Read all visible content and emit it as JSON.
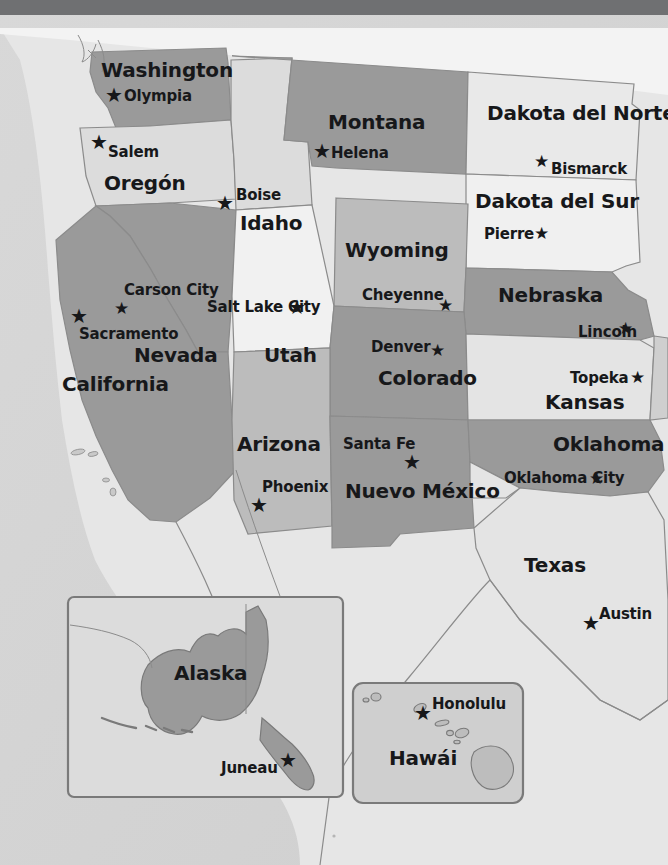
{
  "map": {
    "title": "Mapa del Oeste de Estados Unidos",
    "language": "es",
    "colors": {
      "ocean": "#d3d3d3",
      "land_light": "#eeeeee",
      "state_light": "#dcdcdc",
      "state_mid": "#c6c6c6",
      "state_dark": "#9a9a9a",
      "border": "#8b8b8b",
      "text": "#17181a",
      "topbar": "#6f7072",
      "inset_border": "#7a7a7a"
    },
    "topbar_height": 15
  },
  "states": [
    {
      "name": "Washington",
      "label_x": 101,
      "label_y": 60,
      "tone": "dark",
      "two_line": false
    },
    {
      "name": "Oregón",
      "label_x": 104,
      "label_y": 173,
      "tone": "light",
      "two_line": false
    },
    {
      "name": "Idaho",
      "label_x": 240,
      "label_y": 213,
      "tone": "light",
      "two_line": false
    },
    {
      "name": "Montana",
      "label_x": 328,
      "label_y": 112,
      "tone": "dark",
      "two_line": false
    },
    {
      "name": "Dakota del Norte",
      "label_x": 490,
      "label_y": 103,
      "tone": "light",
      "two_line": true
    },
    {
      "name": "Dakota del Sur",
      "label_x": 478,
      "label_y": 191,
      "tone": "light",
      "two_line": false
    },
    {
      "name": "Wyoming",
      "label_x": 345,
      "label_y": 240,
      "tone": "mid",
      "two_line": false
    },
    {
      "name": "Nebraska",
      "label_x": 500,
      "label_y": 285,
      "tone": "dark",
      "two_line": false
    },
    {
      "name": "Nevada",
      "label_x": 134,
      "label_y": 345,
      "tone": "dark",
      "two_line": false
    },
    {
      "name": "Utah",
      "label_x": 264,
      "label_y": 345,
      "tone": "light",
      "two_line": false
    },
    {
      "name": "California",
      "label_x": 62,
      "label_y": 374,
      "tone": "dark",
      "two_line": false
    },
    {
      "name": "Colorado",
      "label_x": 378,
      "label_y": 368,
      "tone": "dark",
      "two_line": false
    },
    {
      "name": "Kansas",
      "label_x": 545,
      "label_y": 392,
      "tone": "light",
      "two_line": false
    },
    {
      "name": "Arizona",
      "label_x": 237,
      "label_y": 434,
      "tone": "mid",
      "two_line": false
    },
    {
      "name": "Nuevo México",
      "label_x": 360,
      "label_y": 481,
      "tone": "dark",
      "two_line": true
    },
    {
      "name": "Oklahoma",
      "label_x": 553,
      "label_y": 434,
      "tone": "dark",
      "two_line": false
    },
    {
      "name": "Texas",
      "label_x": 524,
      "label_y": 555,
      "tone": "light",
      "two_line": false
    },
    {
      "name": "Alaska",
      "label_x": 174,
      "label_y": 663,
      "tone": "dark",
      "two_line": false
    },
    {
      "name": "Hawái",
      "label_x": 389,
      "label_y": 748,
      "tone": "dark",
      "two_line": false
    }
  ],
  "capitals": [
    {
      "city": "Olympia",
      "state": "Washington",
      "label_x": 124,
      "label_y": 89,
      "star_x": 105,
      "star_y": 85,
      "two_line": false
    },
    {
      "city": "Salem",
      "state": "Oregón",
      "label_x": 108,
      "label_y": 145,
      "star_x": 90,
      "star_y": 132,
      "two_line": false
    },
    {
      "city": "Boise",
      "state": "Idaho",
      "label_x": 236,
      "label_y": 188,
      "star_x": 216,
      "star_y": 193,
      "two_line": false
    },
    {
      "city": "Helena",
      "state": "Montana",
      "label_x": 331,
      "label_y": 146,
      "star_x": 313,
      "star_y": 141,
      "two_line": false
    },
    {
      "city": "Bismarck",
      "state": "Dakota del Norte",
      "label_x": 551,
      "label_y": 162,
      "star_x": 534,
      "star_y": 153,
      "two_line": false
    },
    {
      "city": "Pierre",
      "state": "Dakota del Sur",
      "label_x": 484,
      "label_y": 227,
      "star_x": 534,
      "star_y": 225,
      "two_line": false
    },
    {
      "city": "Cheyenne",
      "state": "Wyoming",
      "label_x": 362,
      "label_y": 288,
      "star_x": 438,
      "star_y": 297,
      "two_line": false
    },
    {
      "city": "Carson City",
      "state": "Nevada",
      "label_x": 130,
      "label_y": 283,
      "star_x": 114,
      "star_y": 300,
      "two_line": true
    },
    {
      "city": "Sacramento",
      "state": "California",
      "label_x": 79,
      "label_y": 327,
      "star_x": 70,
      "star_y": 306,
      "two_line": false
    },
    {
      "city": "Salt Lake City",
      "state": "Utah",
      "label_x": 211,
      "label_y": 300,
      "star_x": 288,
      "star_y": 297,
      "two_line": true
    },
    {
      "city": "Denver",
      "state": "Colorado",
      "label_x": 371,
      "label_y": 340,
      "star_x": 430,
      "star_y": 342,
      "two_line": false
    },
    {
      "city": "Lincoln",
      "state": "Nebraska",
      "label_x": 578,
      "label_y": 325,
      "star_x": 618,
      "star_y": 320,
      "two_line": false
    },
    {
      "city": "Topeka",
      "state": "Kansas",
      "label_x": 570,
      "label_y": 371,
      "star_x": 630,
      "star_y": 369,
      "two_line": false
    },
    {
      "city": "Phoenix",
      "state": "Arizona",
      "label_x": 262,
      "label_y": 480,
      "star_x": 250,
      "star_y": 495,
      "two_line": false
    },
    {
      "city": "Santa Fe",
      "state": "Nuevo México",
      "label_x": 343,
      "label_y": 437,
      "star_x": 403,
      "star_y": 452,
      "two_line": false
    },
    {
      "city": "Oklahoma City",
      "state": "Oklahoma",
      "label_x": 506,
      "label_y": 471,
      "star_x": 589,
      "star_y": 470,
      "two_line": true
    },
    {
      "city": "Austin",
      "state": "Texas",
      "label_x": 599,
      "label_y": 607,
      "star_x": 582,
      "star_y": 613,
      "two_line": false
    },
    {
      "city": "Juneau",
      "state": "Alaska",
      "label_x": 221,
      "label_y": 761,
      "star_x": 279,
      "star_y": 750,
      "two_line": false
    },
    {
      "city": "Honolulu",
      "state": "Hawái",
      "label_x": 432,
      "label_y": 697,
      "star_x": 414,
      "star_y": 703,
      "two_line": false
    }
  ],
  "insets": [
    {
      "name": "Alaska",
      "x": 68,
      "y": 597,
      "width": 275,
      "height": 200,
      "radius": 6
    },
    {
      "name": "Hawái",
      "x": 353,
      "y": 683,
      "width": 170,
      "height": 120,
      "radius": 10
    }
  ],
  "icons": {
    "capital_star": "★"
  }
}
